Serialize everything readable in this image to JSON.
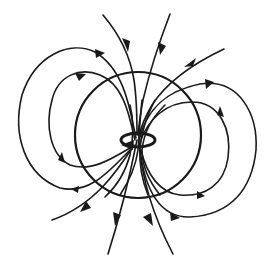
{
  "diagram": {
    "title": "",
    "colors": {
      "stroke": "#1a1a1a",
      "background": "#ffffff"
    },
    "elements": {
      "reference_circle": {
        "cx": 138,
        "cy": 135,
        "r": 63
      },
      "current_loop": {
        "cx": 138,
        "cy": 140,
        "rx": 16,
        "ry": 7,
        "direction_arrow": "pointing-left-at-front"
      }
    },
    "field_lines": {
      "through_center_count": 8,
      "left_closed_loops": 2,
      "right_closed_loops": 2,
      "open_top_lines": 3,
      "open_bottom_lines": 3
    }
  }
}
